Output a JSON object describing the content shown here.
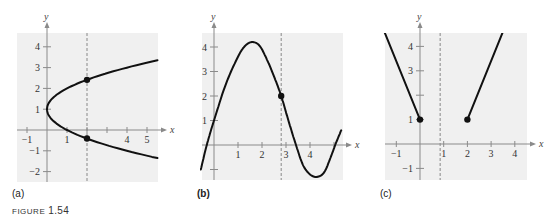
{
  "figure": {
    "caption_prefix": "FIGURE",
    "caption_number": "1.54"
  },
  "chart_data": [
    {
      "type": "line",
      "panel_label": "(a)",
      "title": "",
      "xlabel": "x",
      "ylabel": "y",
      "xlim": [
        -1.5,
        5.5
      ],
      "ylim": [
        -2.5,
        4.5
      ],
      "grid": false,
      "x_ticks": [
        -1,
        1,
        2,
        3,
        4,
        5
      ],
      "x_tick_labels": [
        "-1",
        "1",
        "",
        "",
        "4",
        "5"
      ],
      "y_ticks": [
        -2,
        -1,
        1,
        2,
        3,
        4
      ],
      "y_tick_labels": [
        "-2",
        "-1",
        "1",
        "2",
        "3",
        "4"
      ],
      "description": "Sideways parabola x = (y - 1)^2, vertex at (0, 1)",
      "series": [
        {
          "name": "curve",
          "parametric": "x=(y-1)^2",
          "y_range": [
            -1.35,
            3.35
          ]
        }
      ],
      "vertical_dashed_line": 2,
      "points": [
        [
          2,
          2.41
        ],
        [
          2,
          -0.41
        ]
      ],
      "box": {
        "left": 17,
        "top": 33,
        "right": 158,
        "bottom": 182,
        "ox": 47,
        "oy": 130,
        "sx": 20,
        "sy": 20.8
      }
    },
    {
      "type": "line",
      "panel_label": "(b)",
      "title": "",
      "xlabel": "x",
      "ylabel": "y",
      "xlim": [
        -0.55,
        5.3
      ],
      "ylim": [
        -1.5,
        4.6
      ],
      "grid": false,
      "x_ticks": [
        1,
        2,
        3,
        4,
        5
      ],
      "x_tick_labels": [
        "1",
        "2",
        "3",
        "4",
        ""
      ],
      "y_ticks": [
        -1,
        1,
        2,
        3,
        4
      ],
      "y_tick_labels": [
        "",
        "1",
        "2",
        "3",
        "4"
      ],
      "description": "Wave-like curve: max about 4.2 near x=1.6, min about -1.3 near x=4.3",
      "series": [
        {
          "name": "curve",
          "x": [
            -0.55,
            -0.3,
            0,
            0.5,
            1.0,
            1.3,
            1.6,
            1.9,
            2.2,
            2.5,
            2.8,
            3.1,
            3.4,
            3.7,
            4.0,
            4.3,
            4.6,
            4.9,
            5.05,
            5.3
          ],
          "y": [
            -1.0,
            0,
            1.0,
            2.5,
            3.6,
            4.05,
            4.2,
            4.05,
            3.5,
            2.8,
            2.0,
            1.0,
            0.05,
            -0.8,
            -1.2,
            -1.3,
            -1.1,
            -0.4,
            0,
            0.6
          ]
        }
      ],
      "vertical_dashed_line": 2.8,
      "points": [
        [
          2.8,
          2.0
        ]
      ],
      "box": {
        "left": 202,
        "top": 33,
        "right": 343,
        "bottom": 180,
        "ox": 214,
        "oy": 145,
        "sx": 24,
        "sy": 24.5
      }
    },
    {
      "type": "line",
      "panel_label": "(c)",
      "title": "",
      "xlabel": "x",
      "ylabel": "y",
      "xlim": [
        -1.5,
        4.5
      ],
      "ylim": [
        -1.5,
        4.6
      ],
      "grid": false,
      "x_ticks": [
        -1,
        1,
        2,
        3,
        4
      ],
      "x_tick_labels": [
        "-1",
        "1",
        "2",
        "3",
        "4"
      ],
      "y_ticks": [
        -1,
        1,
        2,
        3,
        4
      ],
      "y_tick_labels": [
        "-1",
        "1",
        "",
        "3",
        "4"
      ],
      "description": "Two rays: left ray ending at closed point (0,1) going up-left; right ray starting at closed point (2,1) going up-right",
      "series": [
        {
          "name": "left-ray",
          "x": [
            -1.5,
            0
          ],
          "y": [
            4.6,
            1
          ]
        },
        {
          "name": "right-ray",
          "x": [
            2,
            3.5
          ],
          "y": [
            1,
            4.6
          ]
        }
      ],
      "vertical_dashed_line": 0.85,
      "points": [
        [
          0,
          1
        ],
        [
          2,
          1
        ]
      ],
      "box": {
        "left": 385,
        "top": 33,
        "right": 527,
        "bottom": 180,
        "ox": 420,
        "oy": 144,
        "sx": 23.7,
        "sy": 24.4
      }
    }
  ]
}
